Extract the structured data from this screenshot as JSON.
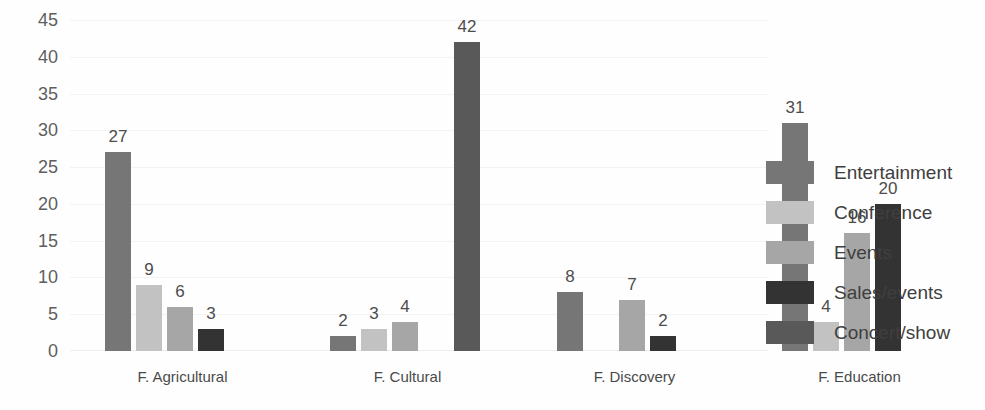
{
  "chart_data": {
    "type": "bar",
    "title": "",
    "xlabel": "",
    "ylabel": "",
    "ylim": [
      0,
      45
    ],
    "yticks": [
      45,
      40,
      35,
      30,
      25,
      20,
      15,
      10,
      5,
      0
    ],
    "grid": true,
    "legend_position": "right",
    "categories": [
      "F. Agricultural",
      "F. Cultural",
      "F. Discovery",
      "F. Education"
    ],
    "series": [
      {
        "name": "Entertainment",
        "color": "#767676",
        "values": [
          27,
          2,
          8,
          31
        ]
      },
      {
        "name": "Conference",
        "color": "#c2c2c2",
        "values": [
          9,
          3,
          null,
          4
        ]
      },
      {
        "name": "Events",
        "color": "#a6a6a6",
        "values": [
          6,
          4,
          7,
          16
        ]
      },
      {
        "name": "Sales/events",
        "color": "#333333",
        "values": [
          3,
          null,
          2,
          20
        ]
      },
      {
        "name": "Concert/show",
        "color": "#595959",
        "values": [
          null,
          42,
          null,
          null
        ]
      }
    ]
  },
  "axis": {
    "y_tick_labels": [
      "45",
      "40",
      "35",
      "30",
      "25",
      "20",
      "15",
      "10",
      "5",
      "0"
    ]
  },
  "groups": [
    {
      "label": "F. Agricultural",
      "bars": [
        {
          "series": "Entertainment",
          "value": 27,
          "label": "27",
          "color": "#767676"
        },
        {
          "series": "Conference",
          "value": 9,
          "label": "9",
          "color": "#c2c2c2"
        },
        {
          "series": "Events",
          "value": 6,
          "label": "6",
          "color": "#a6a6a6"
        },
        {
          "series": "Sales/events",
          "value": 3,
          "label": "3",
          "color": "#333333"
        },
        {
          "series": "Concert/show",
          "value": null,
          "label": "",
          "color": "#595959"
        }
      ]
    },
    {
      "label": "F. Cultural",
      "bars": [
        {
          "series": "Entertainment",
          "value": 2,
          "label": "2",
          "color": "#767676"
        },
        {
          "series": "Conference",
          "value": 3,
          "label": "3",
          "color": "#c2c2c2"
        },
        {
          "series": "Events",
          "value": 4,
          "label": "4",
          "color": "#a6a6a6"
        },
        {
          "series": "Sales/events",
          "value": null,
          "label": "",
          "color": "#333333"
        },
        {
          "series": "Concert/show",
          "value": 42,
          "label": "42",
          "color": "#595959"
        }
      ]
    },
    {
      "label": "F. Discovery",
      "bars": [
        {
          "series": "Entertainment",
          "value": 8,
          "label": "8",
          "color": "#767676"
        },
        {
          "series": "Conference",
          "value": null,
          "label": "",
          "color": "#c2c2c2"
        },
        {
          "series": "Events",
          "value": 7,
          "label": "7",
          "color": "#a6a6a6"
        },
        {
          "series": "Sales/events",
          "value": 2,
          "label": "2",
          "color": "#333333"
        },
        {
          "series": "Concert/show",
          "value": null,
          "label": "",
          "color": "#595959"
        }
      ]
    },
    {
      "label": "F. Education",
      "bars": [
        {
          "series": "Entertainment",
          "value": 31,
          "label": "31",
          "color": "#767676"
        },
        {
          "series": "Conference",
          "value": 4,
          "label": "4",
          "color": "#c2c2c2"
        },
        {
          "series": "Events",
          "value": 16,
          "label": "16",
          "color": "#a6a6a6"
        },
        {
          "series": "Sales/events",
          "value": 20,
          "label": "20",
          "color": "#333333"
        },
        {
          "series": "Concert/show",
          "value": null,
          "label": "",
          "color": "#595959"
        }
      ]
    }
  ],
  "legend": {
    "items": [
      {
        "label": "Entertainment",
        "color": "#767676"
      },
      {
        "label": "Conference",
        "color": "#c2c2c2"
      },
      {
        "label": "Events",
        "color": "#a6a6a6"
      },
      {
        "label": "Sales/events",
        "color": "#333333"
      },
      {
        "label": "Concert/show",
        "color": "#595959"
      }
    ]
  }
}
